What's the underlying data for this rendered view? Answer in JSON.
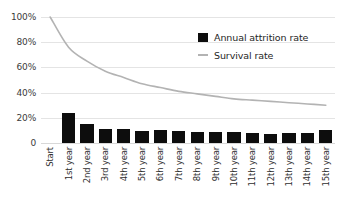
{
  "chart_data": {
    "type": "bar",
    "title": "",
    "xlabel": "",
    "ylabel": "",
    "ylim": [
      0,
      100
    ],
    "grid": true,
    "legend_position": "inside-top-right",
    "categories": [
      "Start",
      "1st year",
      "2nd year",
      "3rd year",
      "4th year",
      "5th year",
      "6th year",
      "7th year",
      "8th year",
      "9th year",
      "10th year",
      "11th year",
      "12th year",
      "13th year",
      "14th year",
      "15th year"
    ],
    "y_ticks": [
      "0",
      "20%",
      "40%",
      "60%",
      "80%",
      "100%"
    ],
    "y_tick_values": [
      0,
      20,
      40,
      60,
      80,
      100
    ],
    "series": [
      {
        "name": "Annual attrition rate",
        "type": "bar",
        "color": "#0d0d0d",
        "values": [
          0,
          24,
          15,
          11,
          11,
          9.5,
          10,
          9.5,
          9,
          8.5,
          8.5,
          8,
          7.5,
          8,
          8,
          10
        ]
      },
      {
        "name": "Survival rate",
        "type": "line",
        "color": "#b3b3b3",
        "values": [
          100,
          76,
          65,
          57,
          52,
          47,
          44,
          41,
          39,
          37,
          35,
          34,
          33,
          32,
          31,
          30
        ]
      }
    ]
  },
  "legend": {
    "items": [
      {
        "label": "Annual attrition rate",
        "marker": "square-swatch",
        "color": "#0d0d0d"
      },
      {
        "label": "Survival rate",
        "marker": "line-swatch",
        "color": "#b3b3b3"
      }
    ]
  },
  "colors": {
    "background": "#ffffff",
    "bar": "#0d0d0d",
    "line": "#b3b3b3",
    "gridline": "#e4e4e4",
    "text": "#2e2e2e"
  }
}
